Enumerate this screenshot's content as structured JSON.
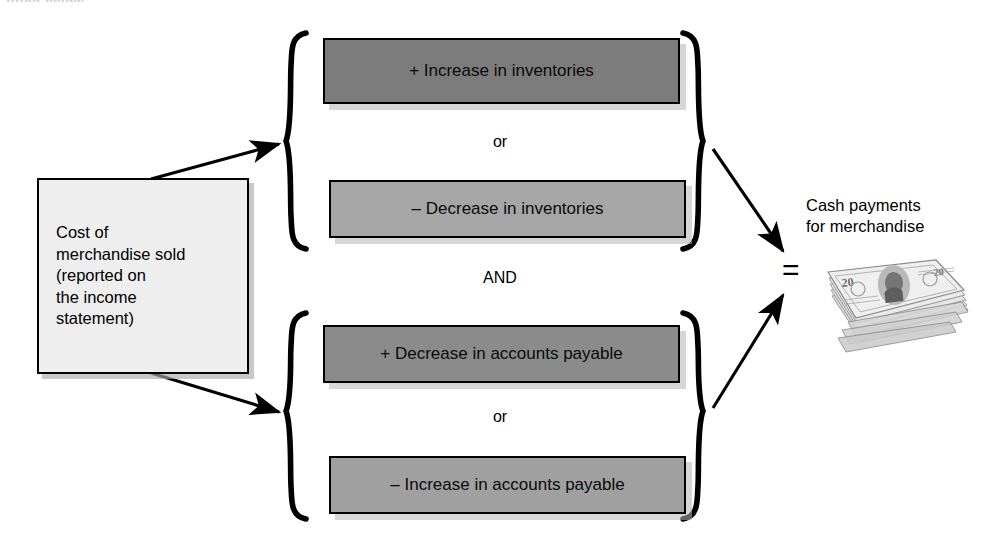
{
  "page": {
    "top_remnant": "fitted below.",
    "background_color": "#ffffff"
  },
  "diagram": {
    "source": {
      "label": "Cost of\nmerchandise sold\n(reported on\nthe income\nstatement)",
      "fill_color": "#eeeeee",
      "border_color": "#000000"
    },
    "groups": [
      {
        "name": "inventories-group",
        "options": [
          {
            "label": "+ Increase in inventories",
            "sign": "+",
            "fill_color": "#7c7c7c"
          },
          {
            "label": "– Decrease in inventories",
            "sign": "–",
            "fill_color": "#a6a6a6"
          }
        ],
        "connector": "or"
      },
      {
        "name": "accounts-payable-group",
        "options": [
          {
            "label": "+ Decrease in accounts payable",
            "sign": "+",
            "fill_color": "#8b8b8b"
          },
          {
            "label": "– Increase in accounts payable",
            "sign": "–",
            "fill_color": "#a0a0a0"
          }
        ],
        "connector": "or"
      }
    ],
    "group_connector": "AND",
    "equals_sign": "=",
    "result": {
      "label": "Cash payments\nfor merchandise",
      "icon": "money-stack-icon",
      "denomination": "20"
    }
  }
}
